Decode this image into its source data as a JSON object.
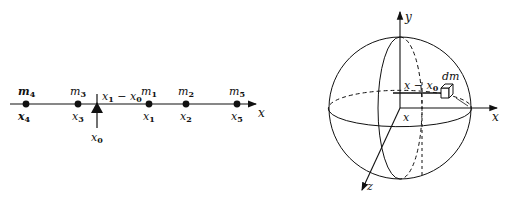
{
  "figure_left": {
    "axis_label": "x",
    "pivot_label": "x0",
    "distance_label": "x1 − x0",
    "masses": [
      {
        "mass": "m4",
        "position": "x4"
      },
      {
        "mass": "m3",
        "position": "x3"
      },
      {
        "mass": "m1",
        "position": "x1"
      },
      {
        "mass": "m2",
        "position": "x2"
      },
      {
        "mass": "m5",
        "position": "x5"
      }
    ]
  },
  "figure_right": {
    "axis_y": "y",
    "axis_x": "x",
    "axis_z": "z",
    "origin_label": "x",
    "distance_label": "x − x0",
    "element_label": "dm"
  },
  "colors": {
    "ink": "#111111",
    "background": "#ffffff"
  }
}
